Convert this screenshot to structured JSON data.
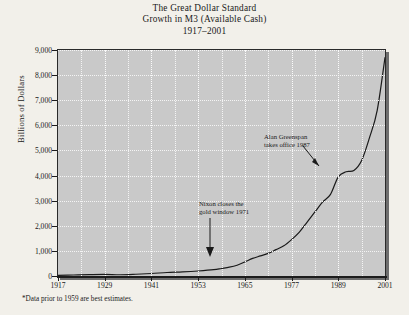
{
  "title": {
    "line1": "The Great Dollar Standard",
    "line2": "Growth in M3 (Available Cash)",
    "line3": "1917–2001"
  },
  "footnote": "*Data prior to 1959 are best estimates.",
  "colors": {
    "page_background": "#f2f0ea",
    "plot_background": "#c9c9c9",
    "gridline": "#f4f4f4",
    "curve": "#1a1a1a",
    "frame": "#2a2a2a",
    "shadow": "#6d6d6d"
  },
  "annotations": [
    {
      "id": "greenspan",
      "line1": "Alan Greenspan",
      "line2": "takes office 1987",
      "target_year": 1987,
      "target_value": 3250
    },
    {
      "id": "nixon",
      "line1": "Nixon closes the",
      "line2": "gold window 1971",
      "target_year": 1971,
      "target_value": 900
    }
  ],
  "chart_data": {
    "type": "line",
    "title": "The Great Dollar Standard Growth in M3 (Available Cash) 1917–2001",
    "xlabel": "",
    "ylabel": "Billions of Dollars",
    "xlim": [
      1917,
      2001
    ],
    "ylim": [
      0,
      9000
    ],
    "grid": true,
    "legend": null,
    "x_ticks": [
      1917,
      1929,
      1941,
      1953,
      1965,
      1977,
      1989,
      2001
    ],
    "x_gridlines": [
      1923,
      1929,
      1935,
      1941,
      1947,
      1953,
      1959,
      1965,
      1971,
      1977,
      1983,
      1989,
      1995
    ],
    "y_ticks": [
      0,
      1000,
      2000,
      3000,
      4000,
      5000,
      6000,
      7000,
      8000,
      9000
    ],
    "y_tick_labels": [
      "0",
      "1,000",
      "2,000",
      "3,000",
      "4,000",
      "5,000",
      "6,000",
      "7,000",
      "8,000",
      "9,000"
    ],
    "series": [
      {
        "name": "M3 (Available Cash)",
        "x": [
          1917,
          1921,
          1925,
          1929,
          1933,
          1937,
          1941,
          1945,
          1949,
          1953,
          1957,
          1959,
          1961,
          1963,
          1965,
          1967,
          1969,
          1971,
          1973,
          1975,
          1977,
          1979,
          1981,
          1983,
          1985,
          1987,
          1989,
          1991,
          1993,
          1995,
          1997,
          1999,
          2001
        ],
        "values": [
          25,
          40,
          55,
          65,
          50,
          70,
          100,
          140,
          165,
          200,
          250,
          300,
          350,
          430,
          560,
          700,
          800,
          900,
          1050,
          1200,
          1450,
          1750,
          2150,
          2550,
          2950,
          3250,
          3950,
          4150,
          4200,
          4600,
          5500,
          6600,
          8700
        ]
      }
    ]
  }
}
